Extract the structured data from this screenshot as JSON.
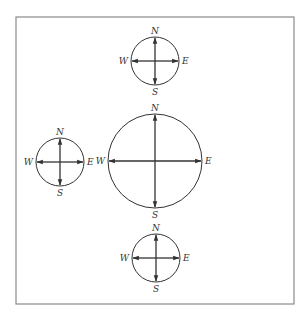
{
  "diagram": {
    "frame": {
      "x": 16,
      "y": 17,
      "width": 278,
      "height": 287,
      "color": "#8a8a8a"
    },
    "line_color": "#333333",
    "compasses": [
      {
        "id": "top",
        "cx": 155,
        "cy": 61,
        "r": 24,
        "labels": {
          "n": "N",
          "s": "S",
          "e": "E",
          "w": "W"
        }
      },
      {
        "id": "center",
        "cx": 155,
        "cy": 161,
        "r": 47,
        "labels": {
          "n": "N",
          "s": "S",
          "e": "E",
          "w": "W"
        }
      },
      {
        "id": "left",
        "cx": 60,
        "cy": 162,
        "r": 24,
        "labels": {
          "n": "N",
          "s": "S",
          "e": "E",
          "w": "W"
        }
      },
      {
        "id": "bottom",
        "cx": 156,
        "cy": 258,
        "r": 24,
        "labels": {
          "n": "N",
          "s": "S",
          "e": "E",
          "w": "W"
        }
      }
    ]
  }
}
